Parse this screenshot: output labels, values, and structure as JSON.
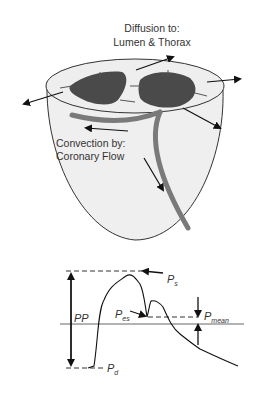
{
  "heart": {
    "title_line1": "Diffusion to:",
    "title_line2": "Lumen & Thorax",
    "convection_line1": "Convection by:",
    "convection_line2": "Coronary Flow"
  },
  "waveform": {
    "pp_label": "PP",
    "ps_label": "P",
    "ps_sub": "s",
    "pes_label": "P",
    "pes_sub": "es",
    "pmean_label": "P",
    "pmean_sub": "mean",
    "pd_label": "P",
    "pd_sub": "d"
  },
  "colors": {
    "heart_fill": "#efefef",
    "chamber_fill": "#4a4a4a",
    "vessel": "#7a7a7a",
    "line": "#222222"
  }
}
